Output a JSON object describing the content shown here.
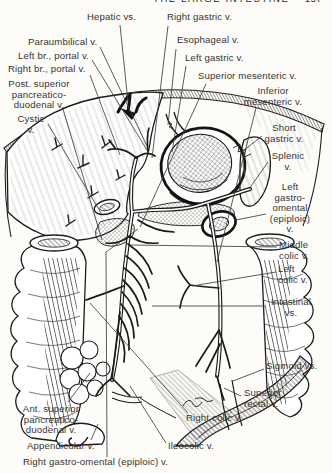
{
  "page": {
    "running_title": "THE LARGE INTESTINE",
    "page_number": "157"
  },
  "colors": {
    "ink": "#1c1c1c",
    "paper": "#fdfcf8",
    "label_text": "#343434",
    "leader_line": "#3f3f3f"
  },
  "figure": {
    "labels": {
      "hepatic_vs": "Hepatic vs.",
      "right_gastric": "Right gastric v.",
      "paraumbilical": "Paraumbilical v.",
      "esophageal": "Esophageal v.",
      "left_br_portal": "Left br., portal v.",
      "left_gastric": "Left gastric v.",
      "right_br_portal": "Right br., portal v.",
      "superior_mesenteric": "Superior mesenteric v.",
      "post_superior_pd": "Post. superior\npancreatico-\nduodenal v.",
      "inferior_mesenteric": "Inferior\nmesenteric v.",
      "cystic": "Cystic\nv.",
      "short_gastric": "Short\ngastric v.",
      "splenic": "Splenic\nv.",
      "left_gastro_omental": "Left\ngastro-\nomental\n(epiploic)\nv.",
      "middle_colic": "Middle\ncolic v.",
      "left_colic": "Left\ncolic v.",
      "intestinal": "Intestinal\nvs.",
      "sigmoid": "Sigmoid vs.",
      "superior_rectal": "Superior\nrectal v.",
      "right_colic": "Right colic v.",
      "ileocolic": "Ileocolic v.",
      "appendicular": "Appendicular v.",
      "right_gastro_omental": "Right gastro-omental (epiploic) v.",
      "ant_superior_pd": "Ant. superior\npancreatico-\nduodenal v."
    }
  }
}
